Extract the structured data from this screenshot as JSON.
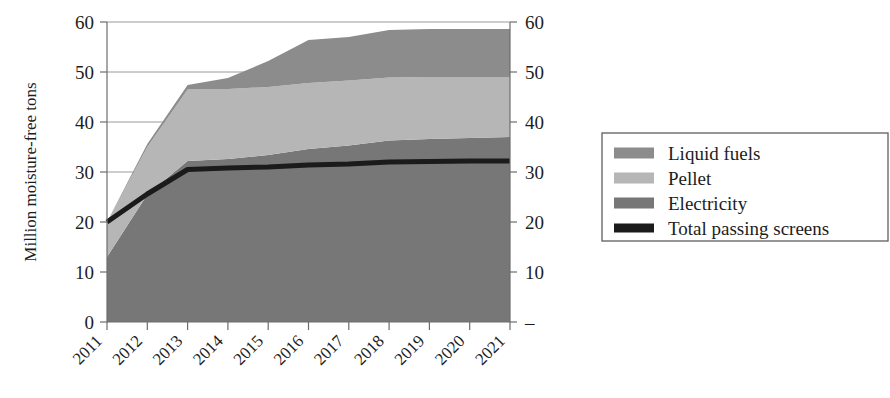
{
  "chart_data": {
    "type": "area",
    "title": "",
    "subtitle": "",
    "xlabel": "",
    "ylabel": "Million moisture-free tons",
    "ylabel_right": "",
    "categories": [
      "2011",
      "2012",
      "2013",
      "2014",
      "2015",
      "2016",
      "2017",
      "2018",
      "2019",
      "2020",
      "2021"
    ],
    "x": [
      2011,
      2012,
      2013,
      2014,
      2015,
      2016,
      2017,
      2018,
      2019,
      2020,
      2021
    ],
    "ylim": [
      0,
      60
    ],
    "yticks": [
      0,
      10,
      20,
      30,
      40,
      50,
      60
    ],
    "ytick_labels_left": [
      "0",
      "10",
      "20",
      "30",
      "40",
      "50",
      "60"
    ],
    "ytick_labels_right": [
      "–",
      "10",
      "20",
      "30",
      "40",
      "50",
      "60"
    ],
    "grid": true,
    "grid_axis": "y",
    "legend_position": "right",
    "stacked": true,
    "stack_order": [
      "Electricity",
      "Pellet",
      "Liquid fuels"
    ],
    "series": [
      {
        "name": "Electricity",
        "color": "#777777",
        "type": "area",
        "values": [
          13.0,
          25.5,
          32.2,
          32.6,
          33.4,
          34.6,
          35.3,
          36.3,
          36.6,
          36.8,
          37.0
        ]
      },
      {
        "name": "Pellet",
        "color": "#b6b6b6",
        "type": "area",
        "values": [
          7.0,
          9.5,
          14.3,
          14.0,
          13.6,
          13.2,
          13.0,
          12.6,
          12.4,
          12.2,
          12.0
        ]
      },
      {
        "name": "Liquid fuels",
        "color": "#8c8c8c",
        "type": "area",
        "values": [
          0.0,
          0.6,
          0.9,
          2.2,
          5.2,
          8.6,
          8.7,
          9.5,
          9.6,
          9.6,
          9.6
        ]
      },
      {
        "name": "Total passing screens",
        "color": "#1b1b1b",
        "type": "line",
        "values": [
          20.0,
          25.6,
          30.5,
          30.8,
          31.0,
          31.4,
          31.6,
          32.0,
          32.1,
          32.2,
          32.2
        ]
      }
    ],
    "cumulative_tops": {
      "electricity": [
        13.0,
        25.5,
        32.2,
        32.6,
        33.4,
        34.6,
        35.3,
        36.3,
        36.6,
        36.8,
        37.0
      ],
      "pellet": [
        20.0,
        35.0,
        46.5,
        46.6,
        47.0,
        47.8,
        48.3,
        48.9,
        49.0,
        49.0,
        49.0
      ],
      "liquid_fuels": [
        20.0,
        35.6,
        47.4,
        48.8,
        52.2,
        56.4,
        57.0,
        58.4,
        58.6,
        58.6,
        58.6
      ]
    }
  },
  "legend": {
    "items": [
      {
        "label": "Liquid fuels",
        "swatch": "#8c8c8c",
        "kind": "area"
      },
      {
        "label": "Pellet",
        "swatch": "#b6b6b6",
        "kind": "area"
      },
      {
        "label": "Electricity",
        "swatch": "#777777",
        "kind": "area"
      },
      {
        "label": "Total passing screens",
        "swatch": "#1b1b1b",
        "kind": "line"
      }
    ]
  },
  "axes": {
    "left": {
      "title": "Million moisture-free tons",
      "ticks": [
        "60",
        "50",
        "40",
        "30",
        "20",
        "10",
        "0"
      ]
    },
    "right": {
      "ticks": [
        "60",
        "50",
        "40",
        "30",
        "20",
        "10",
        "–"
      ]
    },
    "bottom": {
      "ticks": [
        "2011",
        "2012",
        "2013",
        "2014",
        "2015",
        "2016",
        "2017",
        "2018",
        "2019",
        "2020",
        "2021"
      ]
    }
  },
  "colors": {
    "liquid_fuels": "#8c8c8c",
    "pellet": "#b6b6b6",
    "electricity": "#777777",
    "total_line": "#1b1b1b",
    "axis": "#6d6d6d",
    "grid": "#8f8f8f",
    "background": "#ffffff"
  }
}
